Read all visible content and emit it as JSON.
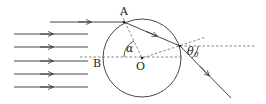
{
  "diagram": {
    "type": "ray-optics-sphere-refraction",
    "labels": {
      "point_a": "A",
      "point_b": "B",
      "center": "O",
      "angle_alpha": "α",
      "angle_theta": "θ",
      "angle_theta_sub": "0"
    },
    "incident_rays": 6,
    "colors": {
      "line": "#333333",
      "dashed": "#555555",
      "background": "#ffffff"
    }
  }
}
